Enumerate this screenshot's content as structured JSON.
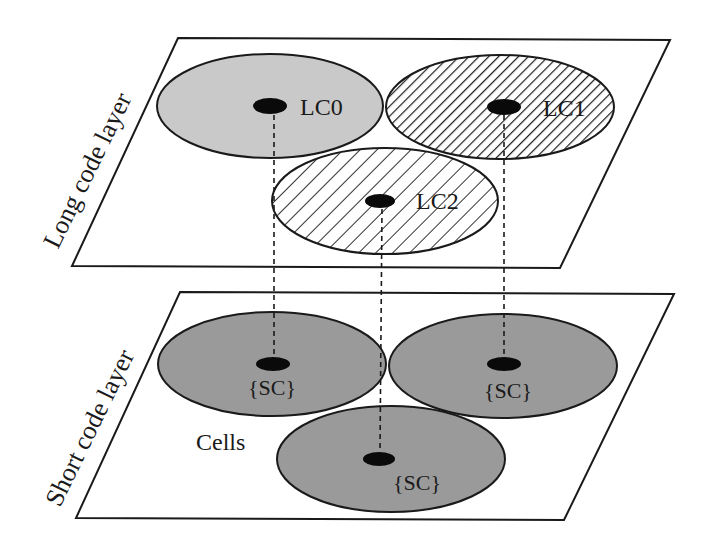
{
  "diagram": {
    "type": "two-layer cell code diagram",
    "colors": {
      "outline": "#1a1a1a",
      "lc0_fill": "#c9c9c9",
      "sc_fill": "#9a9a9a",
      "hatch": "#1a1a1a",
      "background": "#ffffff"
    },
    "top_layer": {
      "label": "Long code layer",
      "cells": [
        {
          "id": "LC0",
          "label": "LC0",
          "fill": "light-gray"
        },
        {
          "id": "LC1",
          "label": "LC1",
          "fill": "dense-hatch"
        },
        {
          "id": "LC2",
          "label": "LC2",
          "fill": "sparse-hatch"
        }
      ]
    },
    "bottom_layer": {
      "label": "Short code layer",
      "group_label": "Cells",
      "cells": [
        {
          "id": "SC-left",
          "label": "{SC}"
        },
        {
          "id": "SC-right",
          "label": "{SC}"
        },
        {
          "id": "SC-bottom",
          "label": "{SC}"
        }
      ]
    },
    "connections": [
      {
        "from": "LC0",
        "to": "SC-left",
        "style": "dashed"
      },
      {
        "from": "LC2",
        "to": "SC-bottom",
        "style": "dashed"
      },
      {
        "from": "LC1",
        "to": "SC-right",
        "style": "dashed"
      }
    ]
  }
}
